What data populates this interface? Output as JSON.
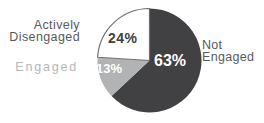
{
  "background": "#ffffff",
  "chart_data": {
    "type": "pie",
    "title": "",
    "start_angle_deg": 0,
    "direction": "clockwise",
    "legend_position": "none",
    "categories": [
      "Not Engaged",
      "Engaged",
      "Actively Disengaged"
    ],
    "values": [
      63,
      13,
      24
    ],
    "outline_color": "#6d6e71",
    "slices": [
      {
        "label": "Not Engaged",
        "label_lines": [
          "Not",
          "Engaged"
        ],
        "value": 63,
        "pct_label": "63%",
        "color": "#414042",
        "pct_label_color": "#ffffff",
        "label_color": "#58595b",
        "label_side": "right",
        "outlined": false
      },
      {
        "label": "Engaged",
        "label_lines": [
          "Engaged"
        ],
        "value": 13,
        "pct_label": "13%",
        "color": "#b1b3b5",
        "pct_label_color": "#ffffff",
        "label_color": "#b4b6b8",
        "label_side": "left",
        "outlined": false
      },
      {
        "label": "Actively Disengaged",
        "label_lines": [
          "Actively",
          "Disengaged"
        ],
        "value": 24,
        "pct_label": "24%",
        "color": "#ffffff",
        "pct_label_color": "#414042",
        "label_color": "#58595b",
        "label_side": "left",
        "outlined": true
      }
    ]
  }
}
